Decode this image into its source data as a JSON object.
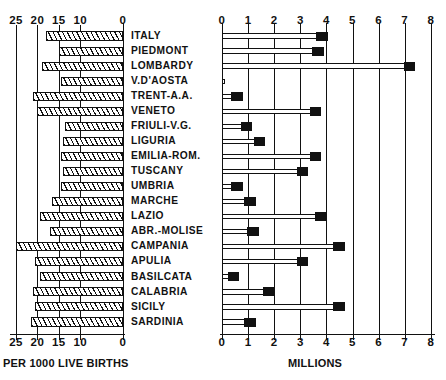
{
  "chart_data": {
    "type": "bar",
    "title": "",
    "orientation": "horizontal",
    "panels": [
      {
        "name": "left",
        "xlabel": "PER 1000 LIVE BIRTHS",
        "ticks": [
          25,
          20,
          15,
          10,
          0
        ],
        "tick_labels": [
          "25",
          "20",
          "15",
          "10",
          "0"
        ],
        "xlim": [
          25,
          0
        ],
        "direction": "right-to-left",
        "grid": true,
        "fill": "hatched",
        "values": [
          18.0,
          15.0,
          19.0,
          14.5,
          21.0,
          20.0,
          13.5,
          14.0,
          14.5,
          14.0,
          14.5,
          16.5,
          19.5,
          17.0,
          25.0,
          20.5,
          19.5,
          21.0,
          20.5,
          21.5
        ]
      },
      {
        "name": "right",
        "xlabel": "MILLIONS",
        "ticks": [
          0,
          1,
          2,
          3,
          4,
          5,
          6,
          7,
          8
        ],
        "tick_labels": [
          "0",
          "1",
          "2",
          "3",
          "4",
          "5",
          "6",
          "7",
          "8"
        ],
        "xlim": [
          0,
          8
        ],
        "direction": "left-to-right",
        "grid": true,
        "fill": "outline-with-black-cap",
        "values": [
          4.05,
          3.9,
          7.4,
          0.1,
          0.8,
          3.8,
          1.15,
          1.65,
          3.8,
          3.3,
          0.8,
          1.3,
          4.0,
          1.4,
          4.7,
          3.3,
          0.65,
          2.0,
          4.7,
          1.3
        ]
      }
    ],
    "categories": [
      "ITALY",
      "PIEDMONT",
      "LOMBARDY",
      "V.D'AOSTA",
      "TRENT-A.A.",
      "VENETO",
      "FRIULI-V.G.",
      "LIGURIA",
      "EMILIA-ROM.",
      "TUSCANY",
      "UMBRIA",
      "MARCHE",
      "LAZIO",
      "ABR.-MOLISE",
      "CAMPANIA",
      "APULIA",
      "BASILCATA",
      "CALABRIA",
      "SICILY",
      "SARDINIA"
    ]
  },
  "colors": {
    "ink": "#111111",
    "paper": "#ffffff"
  }
}
